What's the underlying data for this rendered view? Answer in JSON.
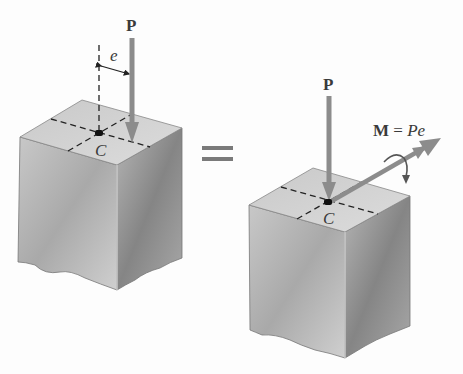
{
  "diagram": {
    "left": {
      "force_label": "P",
      "eccentricity_label": "e",
      "centroid_label": "C"
    },
    "equals": "=",
    "right": {
      "force_label": "P",
      "moment_label_bold": "M",
      "moment_label_eq": " = ",
      "moment_label_expr": "Pe",
      "centroid_label": "C"
    },
    "colors": {
      "arrow": "#8c8c8c",
      "top_face": "#d2d2d2",
      "front_face": "#bdbdbd",
      "side_face": "#9d9d9d",
      "dashes": "#222222"
    }
  }
}
